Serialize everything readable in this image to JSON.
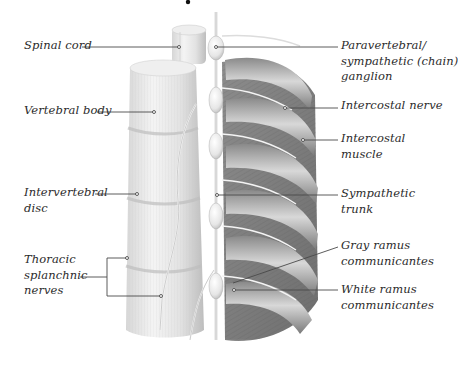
{
  "figure": {
    "colors": {
      "background": "#ffffff",
      "label_text": "#2b2b2b",
      "leader_line": "#4a4a4a",
      "bone": "#e6e6e6",
      "rib": "#9a9a9a",
      "muscle": "#7d7d7d",
      "nerve": "#f2f2f2"
    },
    "labels_left": {
      "spinal_cord": "Spinal cord",
      "vertebral_body": "Vertebral body",
      "intervertebral_disc": "Intervertebral\ndisc",
      "thoracic_splanchnic_nerves": "Thoracic\nsplanchnic\nnerves"
    },
    "labels_right": {
      "paravertebral_ganglion": "Paravertebral/\nsympathetic (chain)\nganglion",
      "intercostal_nerve": "Intercostal nerve",
      "intercostal_muscle": "Intercostal\nmuscle",
      "sympathetic_trunk": "Sympathetic\ntrunk",
      "gray_ramus": "Gray ramus\ncommunicantes",
      "white_ramus": "White ramus\ncommunicantes"
    }
  }
}
